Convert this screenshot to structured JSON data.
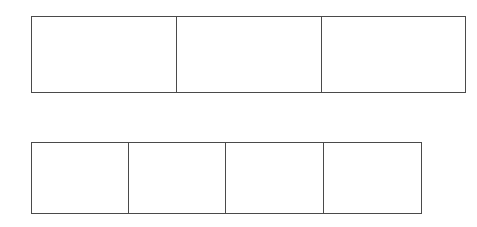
{
  "figure": {
    "kind": "partition-bar-diagram",
    "background_color": "#ffffff",
    "stroke_color": "#4a4a4a",
    "stroke_width_px": 1,
    "canvas": {
      "width": 477,
      "height": 227
    },
    "bars": [
      {
        "name": "top-bar",
        "cell_count": 3,
        "geometry": {
          "x": 31,
          "y": 16,
          "width": 435,
          "height": 77
        },
        "divider_x_positions": [
          176,
          321
        ],
        "cells": [
          {
            "label": ""
          },
          {
            "label": ""
          },
          {
            "label": ""
          }
        ]
      },
      {
        "name": "bottom-bar",
        "cell_count": 4,
        "geometry": {
          "x": 31,
          "y": 142,
          "width": 391,
          "height": 72
        },
        "divider_x_positions": [
          128,
          225,
          323
        ],
        "cells": [
          {
            "label": ""
          },
          {
            "label": ""
          },
          {
            "label": ""
          },
          {
            "label": ""
          }
        ]
      }
    ]
  }
}
